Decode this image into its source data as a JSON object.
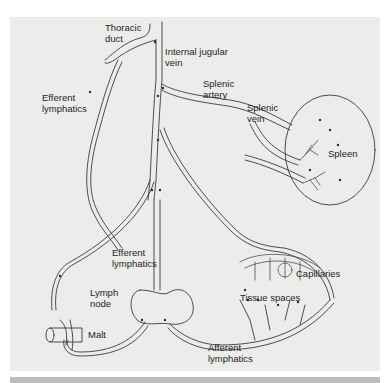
{
  "figure": {
    "type": "lymphatic circulation diagram",
    "colors": {
      "background": "#ececea",
      "line": "#3a3a3a",
      "page": "#ffffff",
      "bottom_bar": "#bdbdbb"
    }
  },
  "labels": {
    "thoracic_duct": "Thoracic\nduct",
    "internal_jugular_vein": "Internal jugular\nvein",
    "efferent_lymphatics_top": "Efferent\nlymphatics",
    "splenic_artery": "Splenic\nartery",
    "splenic_vein": "Splenic\nvein",
    "spleen": "Spleen",
    "efferent_lymphatics_mid": "Efferent\nlymphatics",
    "lymph_node": "Lymph\nnode",
    "capillaries": "Capillaries",
    "tissue_spaces": "Tissue spaces",
    "malt": "Malt",
    "afferent_lymphatics": "Afferent\nlymphatics"
  }
}
